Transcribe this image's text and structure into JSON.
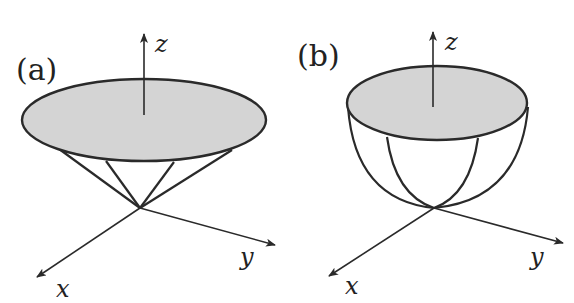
{
  "panels": [
    {
      "id": "a",
      "label": "(a)",
      "shape": "cone",
      "axes": {
        "x": "x",
        "y": "y",
        "z": "z"
      }
    },
    {
      "id": "b",
      "label": "(b)",
      "shape": "paraboloid",
      "axes": {
        "x": "x",
        "y": "y",
        "z": "z"
      }
    }
  ],
  "colors": {
    "stroke": "#2a2a2a",
    "disk_fill": "#d4d4d4",
    "background": "#ffffff"
  }
}
